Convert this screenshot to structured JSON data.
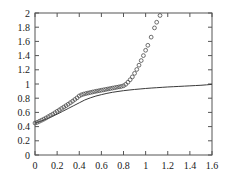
{
  "chart_data": {
    "type": "line",
    "title": "",
    "subtitle": "",
    "xlabel": "",
    "ylabel": "",
    "xlim": [
      0,
      1.6
    ],
    "ylim": [
      0,
      2
    ],
    "xticks": [
      0,
      0.2,
      0.4,
      0.6,
      0.8,
      1,
      1.2,
      1.4,
      1.6
    ],
    "xticklabels": [
      "0",
      "0.2",
      "0.4",
      "0.6",
      "0.8",
      "1",
      "1.2",
      "1.4",
      "1.6"
    ],
    "yticks": [
      0,
      0.2,
      0.4,
      0.6,
      0.8,
      1,
      1.2,
      1.4,
      1.6,
      1.8,
      2
    ],
    "yticklabels": [
      "0",
      "0.2",
      "0.4",
      "0.6",
      "0.8",
      "1",
      "1.2",
      "1.4",
      "1.6",
      "1.8",
      "2"
    ],
    "grid": false,
    "legend": null,
    "legend_position": "none",
    "frame": "box",
    "tick_direction": "in",
    "mirrored_axes": true,
    "colors": {
      "line": "#3a3a3a",
      "marker": "#4a4a4a",
      "frame": "#555555",
      "text": "#1a1a1a",
      "background": "#ffffff"
    },
    "series": [
      {
        "name": "solid-curve",
        "style": "line",
        "marker": "none",
        "x": [
          0,
          0.05,
          0.1,
          0.15,
          0.2,
          0.25,
          0.3,
          0.35,
          0.4,
          0.45,
          0.5,
          0.55,
          0.6,
          0.65,
          0.7,
          0.75,
          0.8,
          0.85,
          0.9,
          0.95,
          1.0,
          1.05,
          1.1,
          1.15,
          1.2,
          1.25,
          1.3,
          1.35,
          1.4,
          1.45,
          1.5,
          1.55,
          1.6
        ],
        "values": [
          0.45,
          0.475,
          0.505,
          0.54,
          0.575,
          0.615,
          0.655,
          0.695,
          0.735,
          0.775,
          0.805,
          0.83,
          0.85,
          0.868,
          0.883,
          0.895,
          0.906,
          0.915,
          0.923,
          0.93,
          0.937,
          0.943,
          0.948,
          0.953,
          0.958,
          0.962,
          0.966,
          0.97,
          0.974,
          0.978,
          0.982,
          0.988,
          0.995
        ]
      },
      {
        "name": "circle-markers",
        "style": "markers",
        "marker": "open-circle",
        "x": [
          0,
          0.02,
          0.04,
          0.06,
          0.08,
          0.1,
          0.12,
          0.14,
          0.16,
          0.18,
          0.2,
          0.22,
          0.24,
          0.26,
          0.28,
          0.3,
          0.32,
          0.34,
          0.36,
          0.38,
          0.4,
          0.42,
          0.44,
          0.46,
          0.48,
          0.5,
          0.52,
          0.54,
          0.56,
          0.58,
          0.6,
          0.62,
          0.64,
          0.66,
          0.68,
          0.7,
          0.72,
          0.74,
          0.76,
          0.78,
          0.8,
          0.82,
          0.84,
          0.86,
          0.88,
          0.9,
          0.92,
          0.94,
          0.96,
          0.98,
          1.0,
          1.02,
          1.05,
          1.08,
          1.1,
          1.13
        ],
        "values": [
          0.45,
          0.46,
          0.475,
          0.49,
          0.505,
          0.522,
          0.54,
          0.558,
          0.575,
          0.595,
          0.615,
          0.635,
          0.655,
          0.675,
          0.695,
          0.715,
          0.737,
          0.758,
          0.782,
          0.805,
          0.832,
          0.848,
          0.858,
          0.866,
          0.873,
          0.88,
          0.887,
          0.894,
          0.9,
          0.906,
          0.912,
          0.918,
          0.924,
          0.93,
          0.936,
          0.942,
          0.948,
          0.954,
          0.96,
          0.966,
          0.975,
          0.995,
          1.025,
          1.06,
          1.1,
          1.15,
          1.205,
          1.265,
          1.33,
          1.4,
          1.475,
          1.545,
          1.66,
          1.79,
          1.87,
          1.965
        ]
      }
    ]
  }
}
